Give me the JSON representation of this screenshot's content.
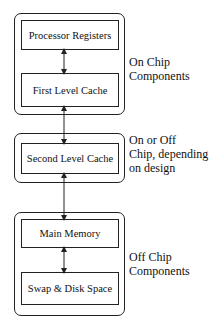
{
  "groups": [
    {
      "label_lines": [
        "On Chip",
        "Components"
      ],
      "boxes": [
        "Processor Registers",
        "First Level Cache"
      ]
    },
    {
      "label_lines": [
        "On or Off",
        "Chip, depending",
        "on design"
      ],
      "boxes": [
        "Second Level Cache"
      ]
    },
    {
      "label_lines": [
        "Off Chip",
        "Components"
      ],
      "boxes": [
        "Main Memory",
        "Swap & Disk Space"
      ]
    }
  ]
}
